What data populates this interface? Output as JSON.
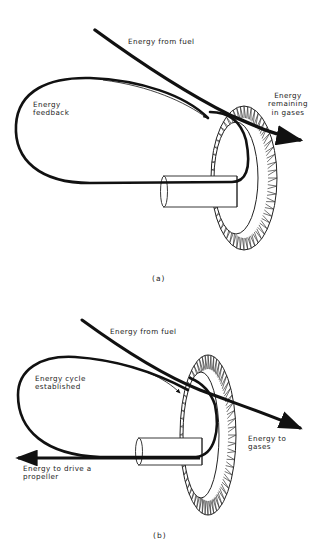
{
  "figure": {
    "background": "#ffffff",
    "ink": "#111111",
    "panels": [
      {
        "id": "a",
        "caption": "(a)",
        "labels": {
          "fuel": "Energy from fuel",
          "feedback_1": "Energy",
          "feedback_2": "feedback",
          "remaining_1": "Energy",
          "remaining_2": "remaining",
          "remaining_3": "in gases"
        }
      },
      {
        "id": "b",
        "caption": "(b)",
        "labels": {
          "fuel": "Energy from fuel",
          "cycle_1": "Energy cycle",
          "cycle_2": "established",
          "gases_1": "Energy to",
          "gases_2": "gases",
          "propeller_1": "Energy to drive a",
          "propeller_2": "propeller"
        }
      }
    ],
    "components": [
      "turbine-wheel",
      "shaft",
      "energy-flow-arrow",
      "feedback-loop"
    ]
  }
}
